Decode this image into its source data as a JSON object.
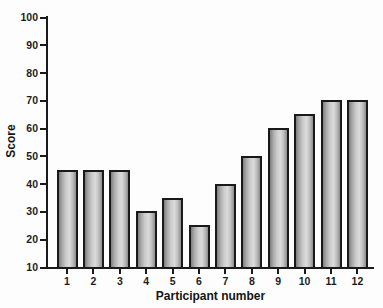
{
  "figure": {
    "background": "#fdfdfd",
    "axis_color": "#1a1a1a",
    "bar_border_color": "#191919",
    "bar_gradient": [
      "#7d7d7d",
      "#a7a7a7",
      "#cdcdcd",
      "#dadada",
      "#bfbfbf",
      "#8d8d8d"
    ]
  },
  "chart_data": {
    "type": "bar",
    "title": "",
    "categories": [
      "1",
      "2",
      "3",
      "4",
      "5",
      "6",
      "7",
      "8",
      "9",
      "10",
      "11",
      "12"
    ],
    "values": [
      45,
      45,
      45,
      30,
      35,
      25,
      40,
      50,
      60,
      65,
      70,
      70
    ],
    "xlabel": "Participant number",
    "ylabel": "Score",
    "ylim": [
      10,
      100
    ],
    "yticks": [
      10,
      20,
      30,
      40,
      50,
      60,
      70,
      80,
      90,
      100
    ],
    "grid": false,
    "legend": null
  }
}
